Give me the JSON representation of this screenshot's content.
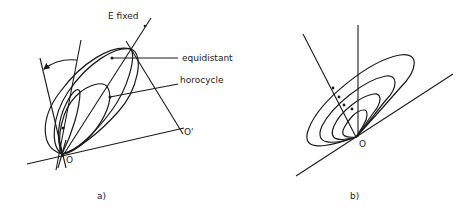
{
  "figure": {
    "panel_a": {
      "caption": "a)",
      "labels": {
        "e_fixed": "E  fixed",
        "equidistant": "equidistant",
        "horocycle": "horocycle",
        "origin": "O",
        "origin_prime": "O'"
      }
    },
    "panel_b": {
      "caption": "b)",
      "labels": {
        "origin": "O"
      },
      "nested_curves": 4
    }
  },
  "colors": {
    "stroke": "#1a1a1a",
    "background": "#ffffff"
  }
}
